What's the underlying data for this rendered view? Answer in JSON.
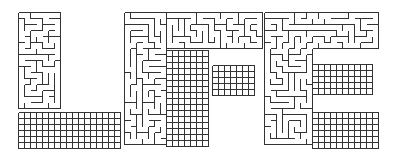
{
  "puzzle": {
    "word": "LIFE",
    "type": "letter-maze",
    "wall_color": "#333333",
    "background": "#ffffff",
    "cell": 6,
    "letters": [
      {
        "char": "L",
        "rects": [
          [
            18,
            12,
            44,
            100
          ],
          [
            18,
            112,
            107,
            36
          ]
        ]
      },
      {
        "char": "I",
        "rects": [
          [
            124,
            12,
            42,
            136
          ]
        ]
      },
      {
        "char": "F",
        "rects": [
          [
            166,
            12,
            96,
            38
          ],
          [
            166,
            50,
            46,
            98
          ],
          [
            212,
            65,
            46,
            35
          ]
        ]
      },
      {
        "char": "E",
        "rects": [
          [
            264,
            12,
            116,
            36
          ],
          [
            264,
            48,
            48,
            100
          ],
          [
            312,
            64,
            60,
            30
          ],
          [
            312,
            112,
            68,
            36
          ]
        ]
      }
    ]
  }
}
